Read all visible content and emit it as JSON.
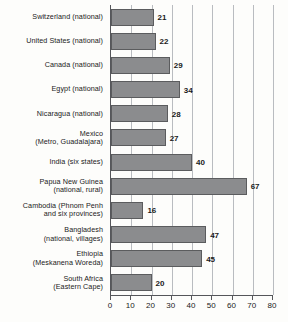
{
  "chart_data": {
    "type": "bar",
    "orientation": "horizontal",
    "title": "",
    "subtitle": "",
    "xlabel": "",
    "ylabel": "",
    "xlim": [
      0,
      80
    ],
    "xticks": [
      0,
      10,
      20,
      30,
      40,
      50,
      60,
      70,
      80
    ],
    "grid": "vertical",
    "legend": "none",
    "bar_color": "#8b8c8e",
    "bar_border_color": "#5b5c5e",
    "gridline_color": "#b9bcc0",
    "axis_color": "#55565a",
    "categories": [
      "Switzerland (national)",
      "United States (national)",
      "Canada (national)",
      "Egypt (national)",
      "Nicaragua (national)",
      "Mexico\n(Metro, Guadalajara)",
      "India (six states)",
      "Papua New Guinea\n(national, rural)",
      "Cambodia (Phnom Penh\nand six provinces)",
      "Bangladesh\n(national, villages)",
      "Ethiopia\n(Meskanena Woreda)",
      "South Africa\n(Eastern Cape)"
    ],
    "values": [
      21,
      22,
      29,
      34,
      28,
      27,
      40,
      67,
      16,
      47,
      45,
      20
    ],
    "data_labels": [
      "21",
      "22",
      "29",
      "34",
      "28",
      "27",
      "40",
      "67",
      "16",
      "47",
      "45",
      "20"
    ],
    "xtick_labels": [
      "0",
      "10",
      "20",
      "30",
      "40",
      "50",
      "60",
      "70",
      "80"
    ]
  }
}
